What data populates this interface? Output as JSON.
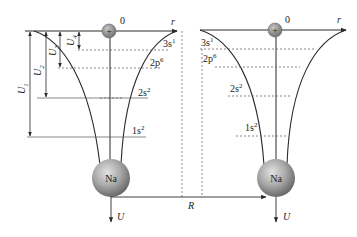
{
  "diagram": {
    "origin_label": "0",
    "axis_label_r": "r",
    "axis_label_U": "U",
    "distance_label": "R",
    "ion_label": "Na",
    "nucleus_symbol": "+",
    "left_atom": {
      "levels": [
        {
          "name": "3s",
          "sup": "1",
          "y": 49
        },
        {
          "name": "2p",
          "sup": "6",
          "y": 68
        },
        {
          "name": "2s",
          "sup": "2",
          "y": 98
        },
        {
          "name": "1s",
          "sup": "2",
          "y": 136
        }
      ],
      "energy_arrows": [
        {
          "name": "U",
          "sub": "1"
        },
        {
          "name": "U",
          "sub": "2"
        },
        {
          "name": "U",
          "sub": "3"
        },
        {
          "name": "U",
          "sub": "4"
        }
      ]
    },
    "right_atom": {
      "levels": [
        {
          "name": "3s",
          "sup": "1",
          "y": 49
        },
        {
          "name": "2p",
          "sup": "6",
          "y": 68
        },
        {
          "name": "2s",
          "sup": "2",
          "y": 98
        },
        {
          "name": "1s",
          "sup": "2",
          "y": 136
        }
      ]
    },
    "colors": {
      "line": "#2a2a2a",
      "dashed": "#555555",
      "ion_fill": "#9a9a9a",
      "ion_dark": "#6e6e6e",
      "ion_light": "#d0d0d0"
    }
  }
}
